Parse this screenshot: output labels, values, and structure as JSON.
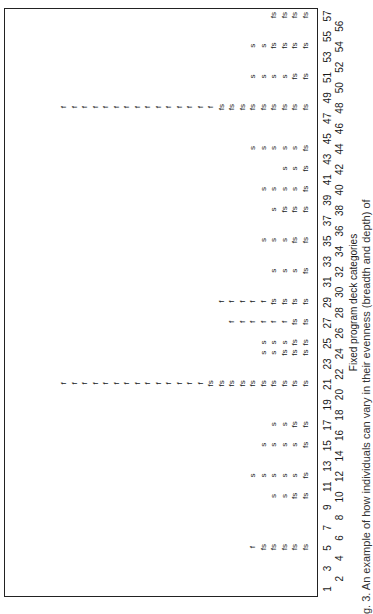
{
  "chart_data": {
    "type": "table",
    "title": "",
    "xlabel": "Fixed program deck categories",
    "ylabel": "",
    "categories": [
      1,
      2,
      3,
      4,
      5,
      6,
      7,
      8,
      9,
      10,
      11,
      12,
      13,
      14,
      15,
      16,
      17,
      18,
      19,
      20,
      21,
      22,
      23,
      24,
      25,
      26,
      27,
      28,
      29,
      30,
      31,
      32,
      33,
      34,
      35,
      36,
      37,
      38,
      39,
      40,
      41,
      42,
      43,
      44,
      45,
      46,
      47,
      48,
      49,
      50,
      51,
      52,
      53,
      54,
      55,
      56,
      57
    ],
    "legend": {
      "f": "fixed",
      "s": "sorted",
      "fs": "fixed and sorted"
    },
    "stacks": [
      {
        "category": 5,
        "marks": [
          "fs",
          "fs",
          "fs",
          "fs",
          "fs",
          "f"
        ]
      },
      {
        "category": 10,
        "marks": [
          "fs",
          "fs",
          "s",
          "s"
        ]
      },
      {
        "category": 12,
        "marks": [
          "fs",
          "s",
          "s",
          "s",
          "s",
          "s"
        ]
      },
      {
        "category": 15,
        "marks": [
          "fs",
          "s",
          "s",
          "s",
          "s"
        ]
      },
      {
        "category": 17,
        "marks": [
          "fs",
          "fs",
          "s",
          "s"
        ]
      },
      {
        "category": 21,
        "marks": [
          "fs",
          "fs",
          "fs",
          "fs",
          "fs",
          "fs",
          "fs",
          "fs",
          "fs",
          "fs",
          "f",
          "f",
          "f",
          "f",
          "f",
          "f",
          "f",
          "f",
          "f",
          "f",
          "f",
          "f",
          "f",
          "f"
        ]
      },
      {
        "category": 24,
        "marks": [
          "fs",
          "fs",
          "fs",
          "s",
          "s"
        ]
      },
      {
        "category": 25,
        "marks": [
          "fs",
          "fs",
          "s",
          "s",
          "s"
        ]
      },
      {
        "category": 27,
        "marks": [
          "fs",
          "fs",
          "f",
          "f",
          "f",
          "f",
          "f",
          "f"
        ]
      },
      {
        "category": 29,
        "marks": [
          "fs",
          "fs",
          "fs",
          "fs",
          "f",
          "f",
          "f",
          "f",
          "f"
        ]
      },
      {
        "category": 32,
        "marks": [
          "fs",
          "s",
          "s",
          "s"
        ]
      },
      {
        "category": 35,
        "marks": [
          "fs",
          "fs",
          "s",
          "s",
          "s"
        ]
      },
      {
        "category": 38,
        "marks": [
          "fs",
          "fs",
          "fs",
          "s"
        ]
      },
      {
        "category": 40,
        "marks": [
          "fs",
          "s",
          "s",
          "s",
          "s"
        ]
      },
      {
        "category": 42,
        "marks": [
          "fs",
          "s",
          "s"
        ]
      },
      {
        "category": 44,
        "marks": [
          "fs",
          "s",
          "s",
          "s",
          "s",
          "s"
        ]
      },
      {
        "category": 48,
        "marks": [
          "fs",
          "fs",
          "fs",
          "fs",
          "fs",
          "fs",
          "fs",
          "fs",
          "fs",
          "f",
          "f",
          "f",
          "f",
          "f",
          "f",
          "f",
          "f",
          "f",
          "f",
          "f",
          "f",
          "f",
          "f",
          "f"
        ]
      },
      {
        "category": 51,
        "marks": [
          "fs",
          "fs",
          "s",
          "s",
          "s",
          "s"
        ]
      },
      {
        "category": 54,
        "marks": [
          "fs",
          "fs",
          "fs",
          "fs",
          "s",
          "s"
        ]
      },
      {
        "category": 57,
        "marks": [
          "fs",
          "fs",
          "fs",
          "fs"
        ]
      }
    ],
    "counts": {
      "5": 6,
      "10": 4,
      "12": 6,
      "15": 5,
      "17": 4,
      "21": 24,
      "24": 5,
      "25": 5,
      "27": 8,
      "29": 9,
      "32": 4,
      "35": 5,
      "38": 4,
      "40": 5,
      "42": 3,
      "44": 6,
      "48": 24,
      "51": 6,
      "54": 6,
      "57": 4
    },
    "orientation": "rotated 90° counter-clockwise"
  },
  "caption": "g. 3.  An example of how individuals can vary in their evenness (breadth and depth) of"
}
